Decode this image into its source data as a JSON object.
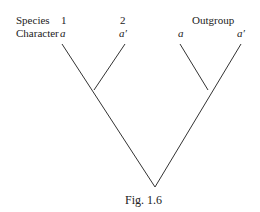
{
  "labels": {
    "species_row": "Species",
    "character_row": "Character",
    "species_1": "1",
    "species_2": "2",
    "outgroup": "Outgroup",
    "char_1": "a",
    "char_2": "a′",
    "char_out_1": "a",
    "char_out_2": "a′"
  },
  "caption": "Fig. 1.6",
  "tree": {
    "line_color": "#333333",
    "root": [
      155,
      187
    ],
    "clade_ingroup_node": [
      94,
      90
    ],
    "clade_outgroup_node": [
      208,
      90
    ],
    "tips": [
      [
        62,
        44
      ],
      [
        125,
        44
      ],
      [
        180,
        44
      ],
      [
        241,
        44
      ]
    ]
  }
}
